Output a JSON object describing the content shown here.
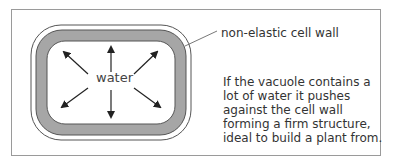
{
  "diagram": {
    "center_label": "water",
    "wall_label": "non-elastic cell wall",
    "caption": "If the vacuole contains a lot of water it pushes against the cell wall forming a firm structure, ideal to build a plant from.",
    "colors": {
      "wall_fill": "#a6a6a6",
      "outline": "#555555",
      "frame": "#9a9a9a",
      "arrow": "#222222"
    },
    "arrows": [
      "up",
      "down",
      "up-left",
      "up-right",
      "down-left",
      "down-right"
    ]
  }
}
